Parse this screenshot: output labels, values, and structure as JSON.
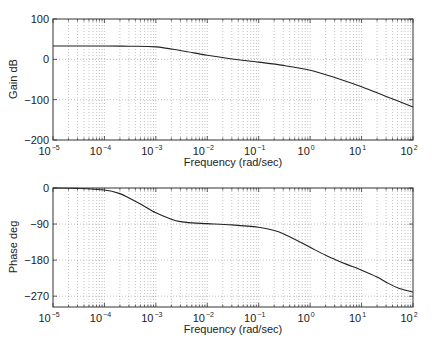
{
  "chart_data": [
    {
      "type": "line",
      "title": "",
      "xlabel": "Frequency (rad/sec)",
      "ylabel": "Gain dB",
      "xscale": "log",
      "xlim": [
        1e-05,
        100
      ],
      "ylim": [
        -200,
        100
      ],
      "grid": true,
      "x_tick_labels": [
        "10^-5",
        "10^-4",
        "10^-3",
        "10^-2",
        "10^-1",
        "10^0",
        "10^1",
        "10^2"
      ],
      "y_ticks": [
        100,
        0,
        -100,
        -200
      ],
      "y_tick_labels": [
        "100",
        "0",
        "−100",
        "−200"
      ],
      "series": [
        {
          "name": "Gain",
          "x": [
            1e-05,
            0.0001,
            0.0003,
            0.001,
            0.003,
            0.01,
            0.03,
            0.1,
            0.3,
            1,
            3,
            10,
            30,
            100
          ],
          "y": [
            33,
            33,
            32.5,
            31,
            22,
            10,
            1,
            -7,
            -15,
            -27,
            -45,
            -68,
            -92,
            -118
          ]
        }
      ]
    },
    {
      "type": "line",
      "title": "",
      "xlabel": "Frequency (rad/sec)",
      "ylabel": "Phase deg",
      "xscale": "log",
      "xlim": [
        1e-05,
        100
      ],
      "ylim": [
        -297,
        0
      ],
      "grid": true,
      "x_tick_labels": [
        "10^-5",
        "10^-4",
        "10^-3",
        "10^-2",
        "10^-1",
        "10^0",
        "10^1",
        "10^2"
      ],
      "y_ticks": [
        0,
        -90,
        -180,
        -270
      ],
      "y_tick_labels": [
        "0",
        "−90",
        "−180",
        "−270"
      ],
      "series": [
        {
          "name": "Phase",
          "x": [
            1e-05,
            3e-05,
            0.0001,
            0.0002,
            0.0003,
            0.0005,
            0.001,
            0.002,
            0.003,
            0.005,
            0.01,
            0.03,
            0.1,
            0.2,
            0.3,
            0.5,
            1,
            2,
            3,
            5,
            10,
            20,
            30,
            50,
            100
          ],
          "y": [
            0,
            -1,
            -5,
            -14,
            -25,
            -40,
            -62,
            -78,
            -84,
            -87,
            -89,
            -92,
            -98,
            -106,
            -114,
            -128,
            -148,
            -168,
            -178,
            -190,
            -205,
            -222,
            -235,
            -249,
            -260
          ]
        }
      ]
    }
  ],
  "plots": {
    "gain": {
      "ylabel": "Gain dB",
      "xlabel": "Frequency (rad/sec)"
    },
    "phase": {
      "ylabel": "Phase deg",
      "xlabel": "Frequency (rad/sec)"
    }
  },
  "colors": {
    "line": "#222222",
    "axes": "#333333",
    "grid": "#9a9a9a",
    "background": "#ffffff"
  }
}
